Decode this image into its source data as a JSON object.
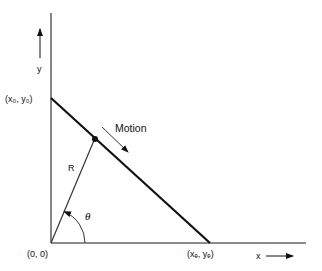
{
  "diagram": {
    "type": "geometry",
    "axes": {
      "x_label": "x",
      "y_label": "y"
    },
    "points": {
      "origin": "(0, 0)",
      "start": "(x₀, y₀)",
      "end": "(xₑ, yₑ)"
    },
    "labels": {
      "motion": "Motion",
      "radius": "R",
      "angle": "θ"
    },
    "colors": {
      "line": "#111111",
      "axis": "#555555",
      "background": "#ffffff"
    }
  }
}
